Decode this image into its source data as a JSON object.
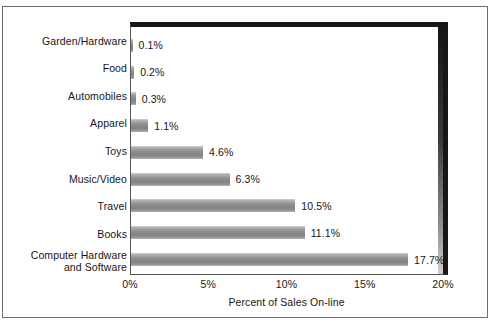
{
  "chart_data": {
    "type": "bar",
    "orientation": "horizontal",
    "title": "",
    "xlabel": "Percent of Sales On-line",
    "ylabel": "",
    "xlim": [
      0,
      20
    ],
    "xticks": [
      "0%",
      "5%",
      "10%",
      "15%",
      "20%"
    ],
    "xtick_values": [
      0,
      5,
      10,
      15,
      20
    ],
    "grid": false,
    "legend": null,
    "categories": [
      "Garden/Hardware",
      "Food",
      "Automobiles",
      "Apparel",
      "Toys",
      "Music/Video",
      "Travel",
      "Books",
      "Computer Hardware and Software"
    ],
    "category_lines": [
      [
        "Garden/Hardware"
      ],
      [
        "Food"
      ],
      [
        "Automobiles"
      ],
      [
        "Apparel"
      ],
      [
        "Toys"
      ],
      [
        "Music/Video"
      ],
      [
        "Travel"
      ],
      [
        "Books"
      ],
      [
        "Computer Hardware",
        "and Software"
      ]
    ],
    "values": [
      0.1,
      0.2,
      0.3,
      1.1,
      4.6,
      6.3,
      10.5,
      11.1,
      17.7
    ],
    "value_labels": [
      "0.1%",
      "0.2%",
      "0.3%",
      "1.1%",
      "4.6%",
      "6.3%",
      "10.5%",
      "11.1%",
      "17.7%"
    ],
    "colors": {
      "bar_light": "#cfcfcf",
      "bar_mid": "#8e8e8e",
      "bar_dark": "#828282",
      "plot_border": "#171717",
      "axis_line": "#555555",
      "text": "#161616",
      "background": "#ffffff"
    }
  }
}
